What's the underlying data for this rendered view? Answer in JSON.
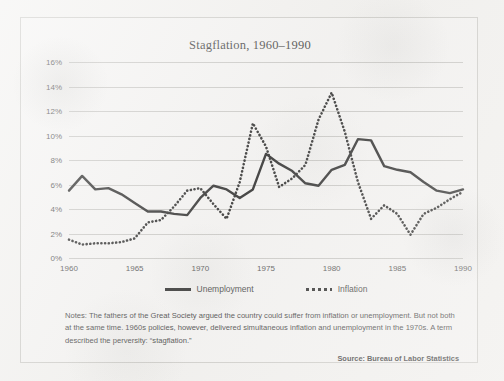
{
  "chart_data": {
    "type": "line",
    "title": "Stagflation, 1960–1990",
    "xlabel": "",
    "ylabel": "",
    "xlim": [
      1960,
      1990
    ],
    "ylim": [
      0,
      16
    ],
    "grid": true,
    "legend_position": "bottom-center",
    "x_ticks": [
      "1960",
      "1965",
      "1970",
      "1975",
      "1980",
      "1985",
      "1990"
    ],
    "y_ticks": [
      "0%",
      "2%",
      "4%",
      "6%",
      "8%",
      "10%",
      "12%",
      "14%",
      "16%"
    ],
    "x": [
      1960,
      1961,
      1962,
      1963,
      1964,
      1965,
      1966,
      1967,
      1968,
      1969,
      1970,
      1971,
      1972,
      1973,
      1974,
      1975,
      1976,
      1977,
      1978,
      1979,
      1980,
      1981,
      1982,
      1983,
      1984,
      1985,
      1986,
      1987,
      1988,
      1989,
      1990
    ],
    "series": [
      {
        "name": "Unemployment",
        "style": "solid",
        "color": "#111111",
        "values": [
          5.5,
          6.7,
          5.6,
          5.7,
          5.2,
          4.5,
          3.8,
          3.8,
          3.6,
          3.5,
          4.9,
          5.9,
          5.6,
          4.9,
          5.6,
          8.5,
          7.7,
          7.1,
          6.1,
          5.9,
          7.2,
          7.6,
          9.7,
          9.6,
          7.5,
          7.2,
          7.0,
          6.2,
          5.5,
          5.3,
          5.6
        ]
      },
      {
        "name": "Inflation",
        "style": "dotted",
        "color": "#111111",
        "values": [
          1.5,
          1.1,
          1.2,
          1.2,
          1.3,
          1.6,
          2.9,
          3.1,
          4.2,
          5.5,
          5.7,
          4.4,
          3.2,
          6.2,
          11.0,
          9.1,
          5.8,
          6.5,
          7.6,
          11.3,
          13.5,
          10.3,
          6.2,
          3.2,
          4.3,
          3.6,
          1.9,
          3.6,
          4.1,
          4.8,
          5.4
        ]
      }
    ]
  },
  "legend": [
    {
      "label": "Unemployment",
      "style": "solid"
    },
    {
      "label": "Inflation",
      "style": "dotted"
    }
  ],
  "notes": "Notes: The fathers of the Great Society argued the country could suffer from inflation or unemployment. But not both at the same time. 1960s policies, however, delivered simultaneous inflation and unemployment in the 1970s. A term described the perversity: “stagflation.”",
  "source": "Source: Bureau of Labor Statistics"
}
